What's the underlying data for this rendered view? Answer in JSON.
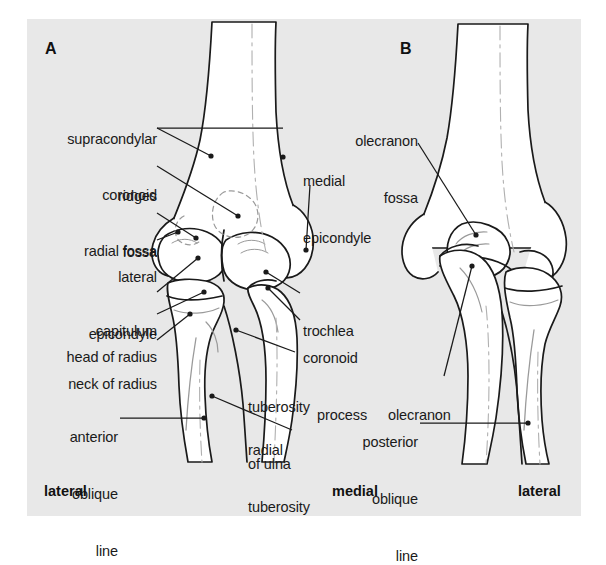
{
  "figure": {
    "background_color": "#e8e8e8",
    "page_color": "#ffffff",
    "line_color": "#1a1a1a",
    "bone_fill": "#ffffff",
    "panels": [
      {
        "letter": "A",
        "view": "anterior"
      },
      {
        "letter": "B",
        "view": "posterior"
      }
    ]
  },
  "panel_a": {
    "letter": "A",
    "labels_left": [
      {
        "id": "supracondylar-ridges",
        "line1": "supracondylar",
        "line2": "ridges"
      },
      {
        "id": "coronoid-fossa",
        "line1": "coronoid",
        "line2": "fossa"
      },
      {
        "id": "radial-fossa",
        "line1": "radial fossa",
        "line2": ""
      },
      {
        "id": "lateral-epicondyle",
        "line1": "lateral",
        "line2": "epicondyle"
      },
      {
        "id": "capitulum",
        "line1": "capitulum",
        "line2": ""
      },
      {
        "id": "head-of-radius",
        "line1": "head of radius",
        "line2": ""
      },
      {
        "id": "neck-of-radius",
        "line1": "neck of radius",
        "line2": ""
      },
      {
        "id": "anterior-oblique-line",
        "line1": "anterior",
        "line2": "oblique",
        "line3": "line"
      }
    ],
    "labels_right": [
      {
        "id": "medial-epicondyle",
        "line1": "medial",
        "line2": "epicondyle"
      },
      {
        "id": "trochlea",
        "line1": "trochlea",
        "line2": ""
      },
      {
        "id": "coronoid-process",
        "line1": "coronoid",
        "line2": "process"
      },
      {
        "id": "tuberosity-of-ulna",
        "line1": "tuberosity",
        "line2": "of ulna"
      },
      {
        "id": "radial-tuberosity",
        "line1": "radial",
        "line2": "tuberosity"
      }
    ],
    "orientation_left": "lateral",
    "orientation_right": "medial"
  },
  "panel_b": {
    "letter": "B",
    "labels": [
      {
        "id": "olecranon-fossa",
        "line1": "olecranon",
        "line2": "fossa"
      },
      {
        "id": "olecranon",
        "line1": "olecranon",
        "line2": ""
      },
      {
        "id": "posterior-oblique-line",
        "line1": "posterior",
        "line2": "oblique",
        "line3": "line"
      }
    ],
    "orientation_right": "lateral"
  },
  "text": {
    "supracondylar_ridges_1": "supracondylar",
    "supracondylar_ridges_2": "ridges",
    "coronoid_fossa_1": "coronoid",
    "coronoid_fossa_2": "fossa",
    "radial_fossa": "radial fossa",
    "lateral_epicondyle_1": "lateral",
    "lateral_epicondyle_2": "epicondyle",
    "capitulum": "capitulum",
    "head_of_radius": "head of radius",
    "neck_of_radius": "neck of radius",
    "anterior_oblique_1": "anterior",
    "anterior_oblique_2": "oblique",
    "anterior_oblique_3": "line",
    "medial_epicondyle_1": "medial",
    "medial_epicondyle_2": "epicondyle",
    "trochlea": "trochlea",
    "coronoid_process_1": "coronoid",
    "coronoid_process_2": "process",
    "tuberosity_of_ulna_1": "tuberosity",
    "tuberosity_of_ulna_2": "of ulna",
    "radial_tuberosity_1": "radial",
    "radial_tuberosity_2": "tuberosity",
    "olecranon_fossa_1": "olecranon",
    "olecranon_fossa_2": "fossa",
    "olecranon": "olecranon",
    "posterior_oblique_1": "posterior",
    "posterior_oblique_2": "oblique",
    "posterior_oblique_3": "line",
    "panel_a_letter": "A",
    "panel_b_letter": "B",
    "orient_lateral_left": "lateral",
    "orient_medial": "medial",
    "orient_lateral_right": "lateral"
  }
}
